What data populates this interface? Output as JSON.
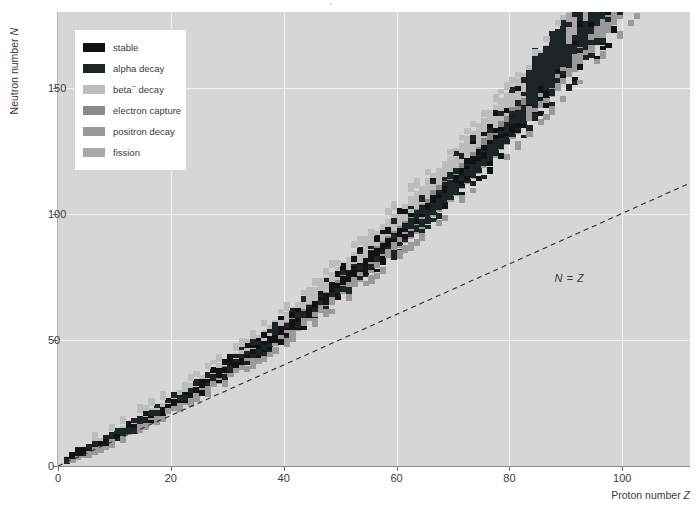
{
  "chart_data": {
    "type": "scatter",
    "title": "",
    "xlabel": "Proton number Z",
    "ylabel": "Neutron number N",
    "xlim": [
      0,
      112
    ],
    "ylim": [
      0,
      180
    ],
    "xticks": [
      0,
      20,
      40,
      60,
      80,
      100
    ],
    "yticks": [
      0,
      50,
      100,
      150
    ],
    "grid": true,
    "legend_position": "upper-left",
    "annotations": [
      {
        "text": "N = Z",
        "x": 88,
        "y": 74,
        "style": "italic"
      }
    ],
    "reference_lines": [
      {
        "label": "N = Z",
        "type": "dashed",
        "from": [
          0,
          0
        ],
        "to": [
          112,
          112
        ],
        "color": "#2b2b2b"
      }
    ],
    "series": [
      {
        "name": "stable",
        "color": "#121212",
        "description": "Valley of stability ridge, runs from (1,0) up to about (83,126)",
        "points": [
          [
            1,
            0
          ],
          [
            1,
            1
          ],
          [
            2,
            1
          ],
          [
            2,
            2
          ],
          [
            3,
            3
          ],
          [
            3,
            4
          ],
          [
            4,
            5
          ],
          [
            5,
            5
          ],
          [
            5,
            6
          ],
          [
            6,
            6
          ],
          [
            6,
            7
          ],
          [
            7,
            7
          ],
          [
            7,
            8
          ],
          [
            8,
            8
          ],
          [
            8,
            9
          ],
          [
            8,
            10
          ],
          [
            9,
            10
          ],
          [
            10,
            10
          ],
          [
            10,
            11
          ],
          [
            10,
            12
          ],
          [
            11,
            12
          ],
          [
            12,
            12
          ],
          [
            12,
            13
          ],
          [
            12,
            14
          ],
          [
            13,
            14
          ],
          [
            14,
            14
          ],
          [
            14,
            15
          ],
          [
            14,
            16
          ],
          [
            15,
            16
          ],
          [
            16,
            16
          ],
          [
            16,
            17
          ],
          [
            16,
            18
          ],
          [
            16,
            20
          ],
          [
            17,
            18
          ],
          [
            17,
            20
          ],
          [
            18,
            18
          ],
          [
            18,
            20
          ],
          [
            18,
            22
          ],
          [
            19,
            20
          ],
          [
            19,
            22
          ],
          [
            20,
            20
          ],
          [
            20,
            22
          ],
          [
            20,
            23
          ],
          [
            20,
            24
          ],
          [
            20,
            26
          ],
          [
            20,
            28
          ],
          [
            21,
            24
          ],
          [
            22,
            24
          ],
          [
            22,
            25
          ],
          [
            22,
            26
          ],
          [
            22,
            27
          ],
          [
            22,
            28
          ],
          [
            23,
            28
          ],
          [
            24,
            26
          ],
          [
            24,
            28
          ],
          [
            24,
            29
          ],
          [
            24,
            30
          ],
          [
            25,
            30
          ],
          [
            26,
            28
          ],
          [
            26,
            30
          ],
          [
            26,
            31
          ],
          [
            26,
            32
          ],
          [
            27,
            32
          ],
          [
            28,
            30
          ],
          [
            28,
            32
          ],
          [
            28,
            33
          ],
          [
            28,
            34
          ],
          [
            28,
            36
          ],
          [
            29,
            34
          ],
          [
            29,
            36
          ],
          [
            30,
            34
          ],
          [
            30,
            36
          ],
          [
            30,
            37
          ],
          [
            30,
            38
          ],
          [
            30,
            40
          ],
          [
            31,
            38
          ],
          [
            31,
            40
          ],
          [
            32,
            38
          ],
          [
            32,
            40
          ],
          [
            32,
            41
          ],
          [
            32,
            42
          ],
          [
            32,
            44
          ],
          [
            33,
            42
          ],
          [
            34,
            40
          ],
          [
            34,
            42
          ],
          [
            34,
            43
          ],
          [
            34,
            44
          ],
          [
            34,
            46
          ],
          [
            35,
            44
          ],
          [
            35,
            46
          ],
          [
            36,
            42
          ],
          [
            36,
            44
          ],
          [
            36,
            46
          ],
          [
            36,
            47
          ],
          [
            36,
            48
          ],
          [
            36,
            50
          ],
          [
            37,
            48
          ],
          [
            38,
            46
          ],
          [
            38,
            48
          ],
          [
            38,
            49
          ],
          [
            38,
            50
          ],
          [
            39,
            50
          ],
          [
            40,
            50
          ],
          [
            40,
            51
          ],
          [
            40,
            52
          ],
          [
            40,
            54
          ],
          [
            41,
            52
          ],
          [
            42,
            50
          ],
          [
            42,
            52
          ],
          [
            42,
            53
          ],
          [
            42,
            54
          ],
          [
            42,
            56
          ],
          [
            44,
            52
          ],
          [
            44,
            54
          ],
          [
            44,
            55
          ],
          [
            44,
            56
          ],
          [
            44,
            57
          ],
          [
            44,
            58
          ],
          [
            45,
            58
          ],
          [
            46,
            56
          ],
          [
            46,
            58
          ],
          [
            46,
            59
          ],
          [
            46,
            60
          ],
          [
            46,
            62
          ],
          [
            47,
            60
          ],
          [
            47,
            62
          ],
          [
            48,
            58
          ],
          [
            48,
            62
          ],
          [
            48,
            63
          ],
          [
            48,
            64
          ],
          [
            48,
            66
          ],
          [
            49,
            66
          ],
          [
            50,
            62
          ],
          [
            50,
            64
          ],
          [
            50,
            66
          ],
          [
            50,
            67
          ],
          [
            50,
            68
          ],
          [
            50,
            69
          ],
          [
            50,
            70
          ],
          [
            50,
            72
          ],
          [
            50,
            74
          ],
          [
            51,
            70
          ],
          [
            51,
            72
          ],
          [
            52,
            68
          ],
          [
            52,
            70
          ],
          [
            52,
            72
          ],
          [
            52,
            73
          ],
          [
            52,
            74
          ],
          [
            52,
            76
          ],
          [
            53,
            74
          ],
          [
            54,
            70
          ],
          [
            54,
            74
          ],
          [
            54,
            76
          ],
          [
            54,
            77
          ],
          [
            54,
            78
          ],
          [
            54,
            80
          ],
          [
            54,
            82
          ],
          [
            55,
            78
          ],
          [
            56,
            76
          ],
          [
            56,
            78
          ],
          [
            56,
            80
          ],
          [
            56,
            81
          ],
          [
            56,
            82
          ],
          [
            57,
            82
          ],
          [
            58,
            78
          ],
          [
            58,
            82
          ],
          [
            58,
            84
          ],
          [
            59,
            82
          ],
          [
            60,
            82
          ],
          [
            60,
            83
          ],
          [
            60,
            84
          ],
          [
            60,
            86
          ],
          [
            60,
            88
          ],
          [
            62,
            82
          ],
          [
            62,
            86
          ],
          [
            62,
            88
          ],
          [
            62,
            90
          ],
          [
            62,
            92
          ],
          [
            63,
            90
          ],
          [
            64,
            90
          ],
          [
            64,
            92
          ],
          [
            64,
            93
          ],
          [
            64,
            94
          ],
          [
            64,
            96
          ],
          [
            65,
            94
          ],
          [
            66,
            94
          ],
          [
            66,
            96
          ],
          [
            66,
            97
          ],
          [
            66,
            98
          ],
          [
            67,
            98
          ],
          [
            68,
            94
          ],
          [
            68,
            98
          ],
          [
            68,
            99
          ],
          [
            68,
            100
          ],
          [
            69,
            100
          ],
          [
            70,
            100
          ],
          [
            70,
            102
          ],
          [
            70,
            103
          ],
          [
            70,
            104
          ],
          [
            70,
            106
          ],
          [
            71,
            104
          ],
          [
            72,
            104
          ],
          [
            72,
            106
          ],
          [
            72,
            107
          ],
          [
            72,
            108
          ],
          [
            73,
            108
          ],
          [
            74,
            108
          ],
          [
            74,
            109
          ],
          [
            74,
            110
          ],
          [
            74,
            112
          ],
          [
            75,
            110
          ],
          [
            76,
            110
          ],
          [
            76,
            112
          ],
          [
            76,
            114
          ],
          [
            76,
            116
          ],
          [
            77,
            114
          ],
          [
            77,
            116
          ],
          [
            78,
            116
          ],
          [
            78,
            117
          ],
          [
            78,
            118
          ],
          [
            78,
            120
          ],
          [
            79,
            118
          ],
          [
            80,
            116
          ],
          [
            80,
            118
          ],
          [
            80,
            119
          ],
          [
            80,
            120
          ],
          [
            80,
            122
          ],
          [
            80,
            124
          ],
          [
            81,
            122
          ],
          [
            81,
            124
          ],
          [
            82,
            124
          ],
          [
            82,
            125
          ],
          [
            82,
            126
          ],
          [
            83,
            126
          ]
        ]
      },
      {
        "name": "alpha decay",
        "color": "#1d2426",
        "description": "Dark region dominating Z > 82 and a spur near Z 60-72 on the proton-rich side"
      },
      {
        "name": "beta− decay",
        "color": "#bdbdbd",
        "description": "Light band above (neutron-rich side of) the stability line, widest near Z 40-90"
      },
      {
        "name": "electron capture",
        "color": "#8a8a8a",
        "description": "Mid-dark band just below (proton-rich side of) the stability line"
      },
      {
        "name": "positron decay",
        "color": "#9a9a9a",
        "description": "Band below the stability line, overlapping electron-capture region"
      },
      {
        "name": "fission",
        "color": "#a8a8a8",
        "description": "Scattered patches in the far upper-right, Z > 90"
      }
    ]
  },
  "axes": {
    "x": {
      "label_prefix": "Proton number ",
      "label_symbol": "Z",
      "ticks": [
        "0",
        "20",
        "40",
        "60",
        "80",
        "100"
      ]
    },
    "y": {
      "label_prefix": "Neutron number ",
      "label_symbol": "N",
      "ticks": [
        "0",
        "50",
        "100",
        "150"
      ]
    }
  },
  "annotation": {
    "nz_line_label": "N = Z"
  },
  "legend": {
    "items": [
      {
        "label": "stable",
        "label_sup": "",
        "label_tail": "",
        "color": "#121212"
      },
      {
        "label": "alpha decay",
        "label_sup": "",
        "label_tail": "",
        "color": "#1d2426"
      },
      {
        "label": "beta",
        "label_sup": "−",
        "label_tail": " decay",
        "color": "#bdbdbd"
      },
      {
        "label": "electron capture",
        "label_sup": "",
        "label_tail": "",
        "color": "#8a8a8a"
      },
      {
        "label": "positron decay",
        "label_sup": "",
        "label_tail": "",
        "color": "#9a9a9a"
      },
      {
        "label": "fission",
        "label_sup": "",
        "label_tail": "",
        "color": "#a8a8a8"
      }
    ]
  },
  "colors": {
    "plot_background": "#d6d6d6",
    "gridline": "#f2f2f2",
    "axis": "#6e6e6e",
    "text": "#3a3a3a",
    "legend_background": "#ffffff"
  }
}
